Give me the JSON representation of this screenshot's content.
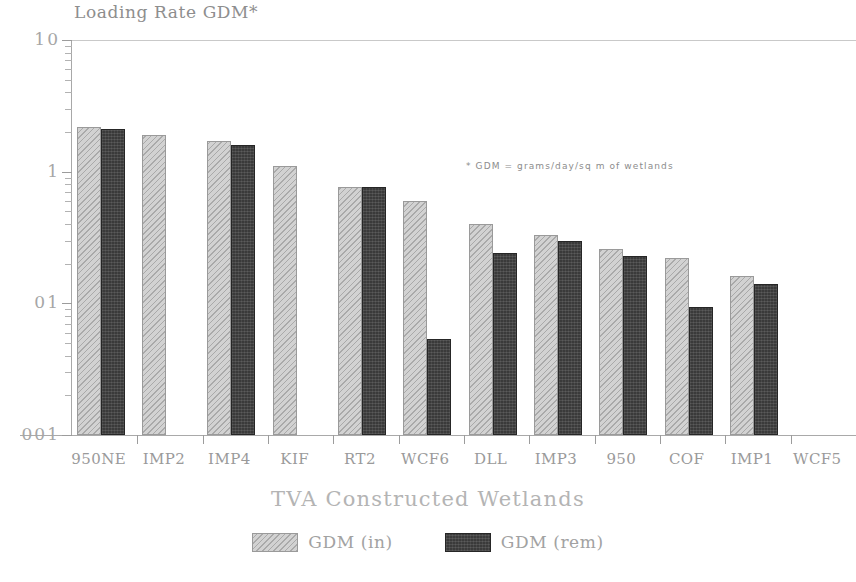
{
  "chart_data": {
    "type": "bar",
    "title": "Loading Rate GDM*",
    "xlabel": "TVA Constructed Wetlands",
    "ylabel": "",
    "yscale": "log",
    "ylim": [
      0.01,
      10
    ],
    "ytick_labels": [
      "10",
      "1",
      "01",
      "001"
    ],
    "ytick_values": [
      10,
      1,
      0.1,
      0.01
    ],
    "grid": false,
    "legend_position": "bottom-center",
    "annotation": "* GDM = grams/day/sq m of wetlands",
    "categories": [
      "950NE",
      "IMP2",
      "IMP4",
      "KIF",
      "RT2",
      "WCF6",
      "DLL",
      "IMP3",
      "950",
      "COF",
      "IMP1",
      "WCF5"
    ],
    "series": [
      {
        "name": "GDM (in)",
        "color": "#d2d2d2",
        "values": [
          2.2,
          1.9,
          1.7,
          1.1,
          0.77,
          0.6,
          0.4,
          0.33,
          0.26,
          0.22,
          0.16,
          null
        ]
      },
      {
        "name": "GDM (rem)",
        "color": "#3a3a3a",
        "values": [
          2.1,
          null,
          1.6,
          null,
          0.76,
          0.054,
          0.24,
          0.3,
          0.23,
          0.093,
          0.14,
          null
        ]
      }
    ]
  },
  "legend": {
    "entries": [
      {
        "label": "GDM (in)",
        "swatch": "hatched-light-swatch"
      },
      {
        "label": "GDM (rem)",
        "swatch": "solid-dark-swatch"
      }
    ]
  }
}
